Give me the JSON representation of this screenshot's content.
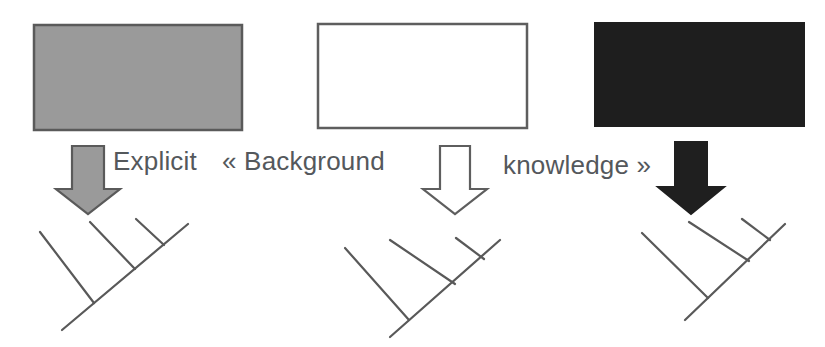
{
  "figure": {
    "width": 825,
    "height": 347,
    "background_color": "#ffffff",
    "text_color": "#54585c"
  },
  "caption": {
    "explicit": "Explicit",
    "background": "« Background",
    "knowledge": "knowledge »",
    "full_text": "Explicit « Background knowledge »"
  },
  "columns": [
    {
      "id": "column-1",
      "label": "gray-filled-column",
      "box": {
        "name": "knowledge-box-gray",
        "fill_color": "#9a9a9a",
        "stroke_color": "#5a5a5a",
        "x": 33,
        "y": 24,
        "width": 210,
        "height": 107,
        "fill_label": "gray"
      },
      "arrow": {
        "name": "down-arrow-gray",
        "fill_color": "#9a9a9a",
        "stroke_color": "#5a5a5a",
        "direction": "down",
        "cx": 88,
        "top": 143,
        "bottom": 212,
        "fill_label": "gray"
      },
      "tree": {
        "name": "cladogram-left",
        "stroke_color": "#595959",
        "tip_count": 4,
        "origin_x": 45,
        "origin_y": 222
      }
    },
    {
      "id": "column-2",
      "label": "white-filled-column",
      "box": {
        "name": "knowledge-box-white",
        "fill_color": "#ffffff",
        "stroke_color": "#5e5e5e",
        "x": 317,
        "y": 23,
        "width": 211,
        "height": 106,
        "fill_label": "white"
      },
      "arrow": {
        "name": "down-arrow-white",
        "fill_color": "#ffffff",
        "stroke_color": "#5e5e5e",
        "direction": "down",
        "cx": 454,
        "top": 144,
        "bottom": 212,
        "fill_label": "white"
      },
      "tree": {
        "name": "cladogram-middle",
        "stroke_color": "#595959",
        "tip_count": 4,
        "origin_x": 327,
        "origin_y": 222
      }
    },
    {
      "id": "column-3",
      "label": "black-filled-column",
      "box": {
        "name": "knowledge-box-black",
        "fill_color": "#1e1e1e",
        "stroke_color": "#1e1e1e",
        "x": 594,
        "y": 22,
        "width": 211,
        "height": 105,
        "fill_label": "black"
      },
      "arrow": {
        "name": "down-arrow-black",
        "fill_color": "#1f1f1f",
        "stroke_color": "#1f1f1f",
        "direction": "down",
        "cx": 690,
        "top": 140,
        "bottom": 212,
        "fill_label": "black"
      },
      "tree": {
        "name": "cladogram-right",
        "stroke_color": "#595959",
        "tip_count": 4,
        "origin_x": 612,
        "origin_y": 222
      }
    }
  ]
}
